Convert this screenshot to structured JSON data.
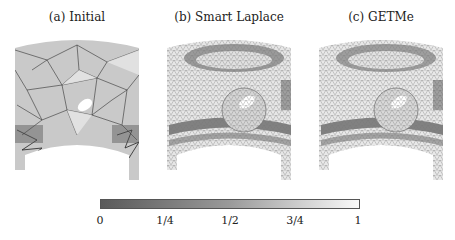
{
  "panels": [
    {
      "label": "(a) Initial",
      "center_x": 77,
      "mesh": "coarse-irregular"
    },
    {
      "label": "(b) Smart Laplace",
      "center_x": 229,
      "mesh": "smoothed"
    },
    {
      "label": "(c) GETMe",
      "center_x": 381,
      "mesh": "smoothed"
    }
  ],
  "colorbar": {
    "ticks": [
      "0",
      "1/4",
      "1/2",
      "3/4",
      "1"
    ],
    "tick_positions": [
      0,
      0.25,
      0.5,
      0.75,
      1
    ],
    "color_min": "#5a5a5a",
    "color_max": "#fafafa"
  }
}
